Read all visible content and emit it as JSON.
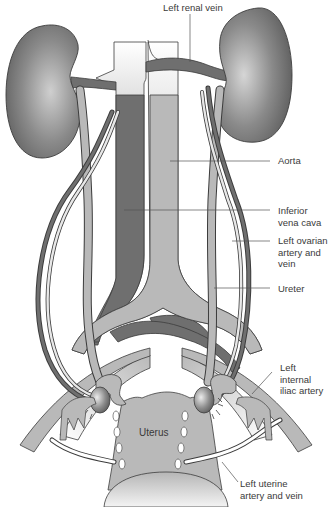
{
  "diagram": {
    "colors": {
      "dark_vessel": "#6f6f6f",
      "light_vessel": "#b9b9b9",
      "kidney": "#7a7a7a",
      "outline": "#3c3c3c",
      "background": "#ffffff",
      "label_text": "#3a3a3a"
    },
    "labels": [
      {
        "id": "left-renal-vein",
        "text": "Left renal vein"
      },
      {
        "id": "aorta",
        "text": "Aorta"
      },
      {
        "id": "inferior-vena-cava",
        "text": "Inferior\nvena cava"
      },
      {
        "id": "left-ovarian-artery-vein",
        "text": "Left ovarian\nartery and\nvein"
      },
      {
        "id": "ureter",
        "text": "Ureter"
      },
      {
        "id": "left-internal-iliac-artery",
        "text": "Left\ninternal\niliac artery"
      },
      {
        "id": "left-uterine-artery-vein",
        "text": "Left uterine\nartery and vein"
      }
    ],
    "organ_labels": {
      "uterus": "Uterus"
    }
  }
}
